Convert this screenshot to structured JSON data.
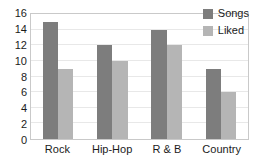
{
  "chart_data": {
    "type": "bar",
    "title": "",
    "subtitle": "",
    "xlabel": "",
    "ylabel": "",
    "categories": [
      "Rock",
      "Hip-Hop",
      "R & B",
      "Country"
    ],
    "series": [
      {
        "name": "Songs",
        "values": [
          15,
          12,
          14,
          9
        ],
        "color": "#7d7d7d"
      },
      {
        "name": "Liked",
        "values": [
          9,
          10,
          12,
          6
        ],
        "color": "#b5b5b5"
      }
    ],
    "ylim": [
      0,
      16
    ],
    "ytick_step": 2,
    "yticks": [
      0,
      2,
      4,
      6,
      8,
      10,
      12,
      14,
      16
    ],
    "ytick_labels": [
      "0",
      "2",
      "4",
      "6",
      "8",
      "10",
      "12",
      "14",
      "16"
    ],
    "grid": {
      "horizontal": true,
      "vertical": false,
      "color": "#e8e8e8"
    },
    "legend": {
      "position": "top-right-inside",
      "entries": [
        "Songs",
        "Liked"
      ]
    },
    "plot_border_color": "#c9c9c9",
    "background": "#ffffff",
    "text_color": "#1b1b1b"
  }
}
